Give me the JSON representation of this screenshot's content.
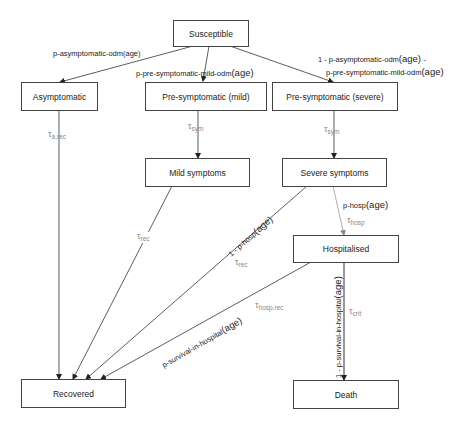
{
  "header": {
    "faint_text": ""
  },
  "nodes": {
    "susceptible": "Susceptible",
    "asymptomatic": "Asymptomatic",
    "presym_mild": "Pre-symptomatic (mild)",
    "presym_severe": "Pre-symptomatic (severe)",
    "mild_symptoms": "Mild symptoms",
    "severe_symptoms": "Severe symptoms",
    "hospitalised": "Hospitalised",
    "recovered": "Recovered",
    "death": "Death"
  },
  "edges": {
    "s_to_asym": {
      "prob": "p-asymptomatic-odm",
      "arg": "(age)"
    },
    "s_to_mild": {
      "prob": "p-pre-symptomatic-mild-odm",
      "arg": "(age)"
    },
    "s_to_severe": {
      "line1_prefix": "1 - p-asymptomatic-odm",
      "line1_arg": "(age)",
      "line1_suffix": " -",
      "line2": "p-pre-symptomatic-mild-odm",
      "line2_arg": "(age)"
    },
    "asym_to_rec": {
      "tau": "τ",
      "sub": "a,rec"
    },
    "presym_mild_to_mild": {
      "tau": "τ",
      "sub": "sym"
    },
    "presym_severe_to_severe": {
      "tau": "τ",
      "sub": "sym"
    },
    "mild_to_rec": {
      "tau": "τ",
      "sub": "rec"
    },
    "severe_to_rec": {
      "prob_prefix": "1 - p-hosp",
      "arg": "(age)",
      "tau": "τ",
      "sub": "rec"
    },
    "severe_to_hosp": {
      "prob": "p-hosp",
      "arg": "(age)",
      "tau": "τ",
      "sub": "hosp"
    },
    "hosp_to_rec": {
      "prob": "p-survival-in-hospital",
      "arg": "(age)",
      "tau": "τ",
      "sub": "hosp.rec"
    },
    "hosp_to_death": {
      "prob": "1 - p-survival-in-hospital",
      "arg": "(age)",
      "tau": "τ",
      "sub": "crit"
    }
  },
  "colors": {
    "line": "#333333",
    "gray_line": "#999999",
    "tau": "#888888",
    "box_border": "#444444"
  }
}
